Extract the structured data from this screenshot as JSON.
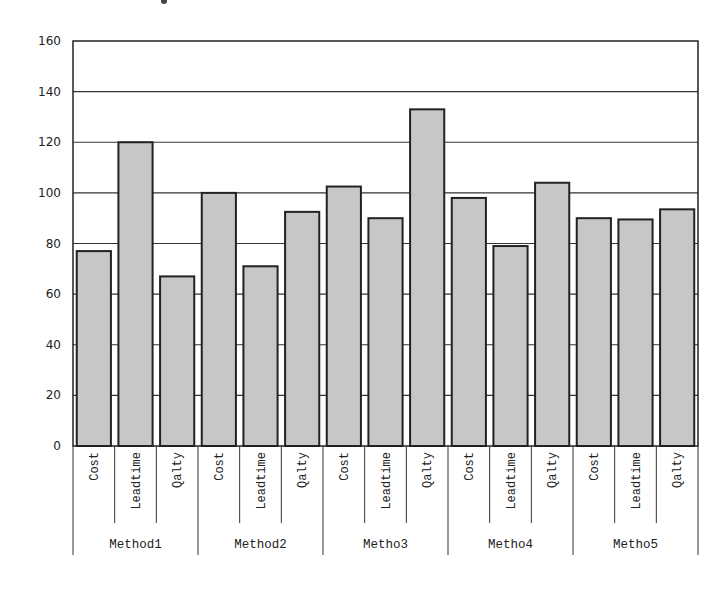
{
  "chart_data": {
    "type": "bar",
    "title": "",
    "xlabel": "",
    "ylabel": "",
    "ylim": [
      0,
      160
    ],
    "yticks": [
      0,
      20,
      40,
      60,
      80,
      100,
      120,
      140,
      160
    ],
    "grid": true,
    "legend": null,
    "groups": [
      {
        "name": "Method1",
        "categories": [
          "Cost",
          "Leadtime",
          "Qalty"
        ],
        "values": [
          77,
          120,
          67
        ]
      },
      {
        "name": "Method2",
        "categories": [
          "Cost",
          "Leadtime",
          "Qalty"
        ],
        "values": [
          100,
          71,
          92.5
        ]
      },
      {
        "name": "Metho3",
        "categories": [
          "Cost",
          "Leadtime",
          "Qalty"
        ],
        "values": [
          102.5,
          90,
          133
        ]
      },
      {
        "name": "Metho4",
        "categories": [
          "Cost",
          "Leadtime",
          "Qalty"
        ],
        "values": [
          98,
          79,
          104
        ]
      },
      {
        "name": "Metho5",
        "categories": [
          "Cost",
          "Leadtime",
          "Qalty"
        ],
        "values": [
          90,
          89.5,
          93.5
        ]
      }
    ],
    "categories": [
      "Cost",
      "Leadtime",
      "Qalty",
      "Cost",
      "Leadtime",
      "Qalty",
      "Cost",
      "Leadtime",
      "Qalty",
      "Cost",
      "Leadtime",
      "Qalty",
      "Cost",
      "Leadtime",
      "Qalty"
    ],
    "values": [
      77,
      120,
      67,
      100,
      71,
      92.5,
      102.5,
      90,
      133,
      98,
      79,
      104,
      90,
      89.5,
      93.5
    ],
    "colors": {
      "bar_fill": "#c7c7c7",
      "bar_stroke": "#222222",
      "grid": "#333333",
      "background": "#ffffff"
    }
  }
}
